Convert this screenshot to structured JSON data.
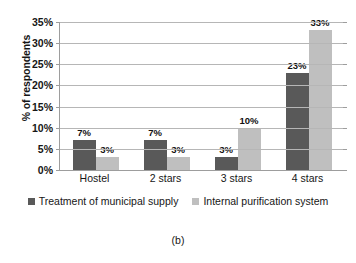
{
  "chart_data": {
    "type": "bar",
    "title": "",
    "xlabel": "",
    "ylabel": "% of respondents",
    "ylim": [
      0,
      35
    ],
    "ytick_step": 5,
    "ytick_labels": [
      "0%",
      "5%",
      "10%",
      "15%",
      "20%",
      "25%",
      "30%",
      "35%"
    ],
    "ytick_values": [
      0,
      5,
      10,
      15,
      20,
      25,
      30,
      35
    ],
    "grid": true,
    "legend_position": "bottom",
    "categories": [
      "Hostel",
      "2 stars",
      "3 stars",
      "4 stars"
    ],
    "series": [
      {
        "name": "Treatment of municipal supply",
        "color": "#595959",
        "values": [
          7,
          7,
          3,
          23
        ],
        "labels": [
          "7%",
          "7%",
          "3%",
          "23%"
        ]
      },
      {
        "name": "Internal purification system",
        "color": "#bfbfbf",
        "values": [
          3,
          3,
          10,
          33
        ],
        "labels": [
          "3%",
          "3%",
          "10%",
          "33%"
        ]
      }
    ]
  },
  "caption": "(b)",
  "colors": {
    "series_dark": "#595959",
    "series_light": "#bfbfbf",
    "gridline": "#b6b6b6",
    "axis": "#9d9d9d",
    "background": "#ffffff",
    "text": "#161616"
  }
}
